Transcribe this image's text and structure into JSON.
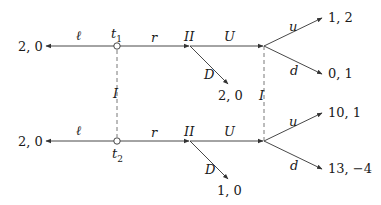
{
  "diagram": {
    "type": "extensive-form game tree",
    "colors": {
      "line": "#333333",
      "dashed": "#555555",
      "text": "#1a1a1a"
    },
    "types": [
      {
        "id": "t1",
        "label": "t",
        "sub": "1"
      },
      {
        "id": "t2",
        "label": "t",
        "sub": "2"
      }
    ],
    "info_set_labels": {
      "type_link": "I",
      "player1_link": "I"
    },
    "top": {
      "left_action": "ℓ",
      "right_action": "r",
      "left_payoff": "2, 0",
      "player2_label": "II",
      "p2_up_action": "U",
      "p2_down_action": "D",
      "p2_down_payoff": "2, 0",
      "p1_up_action": "u",
      "p1_down_action": "d",
      "up_payoff": "1, 2",
      "down_payoff": "0, 1"
    },
    "bottom": {
      "left_action": "ℓ",
      "right_action": "r",
      "left_payoff": "2, 0",
      "player2_label": "II",
      "p2_up_action": "U",
      "p2_down_action": "D",
      "p2_down_payoff": "1, 0",
      "p1_up_action": "u",
      "p1_down_action": "d",
      "up_payoff": "10, 1",
      "down_payoff": "13, −4"
    }
  }
}
